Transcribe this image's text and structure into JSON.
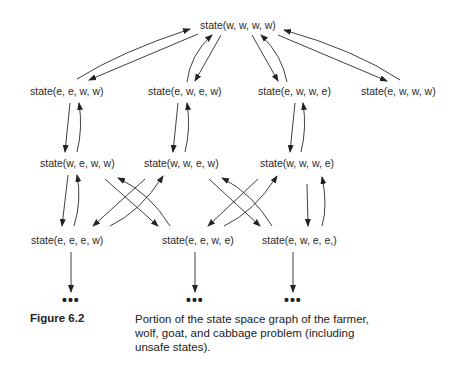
{
  "figure": {
    "label": "Figure 6.2",
    "caption": "Portion of the state space graph of the farmer, wolf, goat, and cabbage problem (including unsafe states)."
  },
  "nodes": {
    "root": "state(w, w, w, w)",
    "r1_1": "state(e, e, w, w)",
    "r1_2": "state(e, w, e, w)",
    "r1_3": "state(e, w, w, e)",
    "r1_4": "state(e, w, w, w)",
    "r2_1": "state(w, e, w, w)",
    "r2_2": "state(w, w, e, w)",
    "r2_3": "state(w, w, w, e)",
    "r3_1": "state(e, e, e, w)",
    "r3_2": "state(e, e, w, e)",
    "r3_3": "state(e, w, e, e,)"
  },
  "continuation": {
    "d1": "•••",
    "d2": "•••",
    "d3": "•••"
  }
}
